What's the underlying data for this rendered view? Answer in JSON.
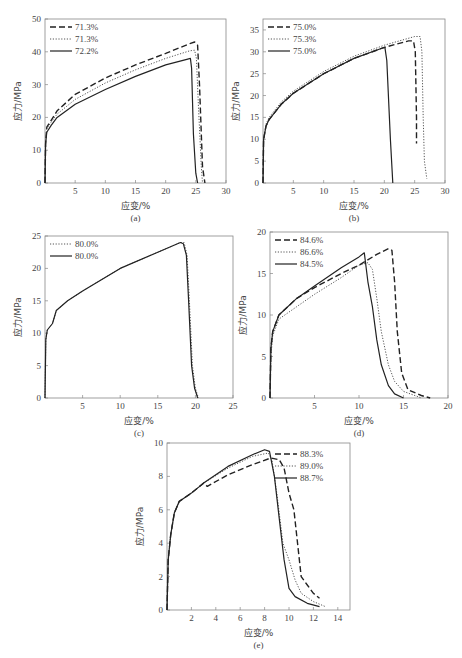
{
  "chart_data": [
    {
      "id": "a",
      "type": "line",
      "caption": "(a)",
      "xlabel": "应变/%",
      "ylabel": "应力/MPa",
      "xlim": [
        0,
        30
      ],
      "ylim": [
        0,
        50
      ],
      "xticks": [
        5,
        10,
        15,
        20,
        25,
        30
      ],
      "yticks": [
        0,
        10,
        20,
        30,
        40,
        50
      ],
      "legend_position": "upper left",
      "frame": {
        "x0": 45,
        "x1": 226,
        "y0": 183,
        "y1": 19
      },
      "series": [
        {
          "name": "71.3%",
          "style": "dashed",
          "x": [
            0,
            0.1,
            0.3,
            1,
            2,
            5,
            10,
            15,
            20,
            24,
            24.8,
            25.3,
            25.6,
            26.1,
            26.5
          ],
          "y": [
            0,
            12,
            17,
            19,
            22,
            27,
            32,
            36,
            39.5,
            42.5,
            43,
            42,
            30,
            5,
            0
          ]
        },
        {
          "name": "71.3%",
          "style": "dotted",
          "x": [
            0,
            0.1,
            0.3,
            1,
            2,
            5,
            10,
            15,
            20,
            24,
            24.8,
            25.1,
            25.4,
            25.9,
            26.1
          ],
          "y": [
            0,
            12,
            16.5,
            18.5,
            21,
            25.5,
            30.5,
            34.5,
            38,
            40.3,
            40.5,
            38,
            25,
            5,
            0
          ]
        },
        {
          "name": "72.2%",
          "style": "solid",
          "x": [
            0,
            0.1,
            0.3,
            1,
            2,
            5,
            10,
            15,
            20,
            23.5,
            24.1,
            24.3,
            24.6,
            25,
            25.3
          ],
          "y": [
            0,
            12,
            15.5,
            17.5,
            20,
            24,
            28.5,
            32.5,
            36,
            37.7,
            38,
            35,
            15,
            3,
            0
          ]
        }
      ]
    },
    {
      "id": "b",
      "type": "line",
      "caption": "(b)",
      "xlabel": "应变/%",
      "ylabel": "应力/MPa",
      "xlim": [
        0,
        30
      ],
      "ylim": [
        0,
        37.5
      ],
      "xticks": [
        5,
        10,
        15,
        20,
        25,
        30
      ],
      "yticks": [
        0,
        5,
        10,
        15,
        20,
        25,
        30,
        35
      ],
      "legend_position": "upper left",
      "frame": {
        "x0": 263,
        "x1": 445,
        "y0": 183,
        "y1": 19
      },
      "series": [
        {
          "name": "75.0%",
          "style": "dashed",
          "x": [
            0,
            0.1,
            0.5,
            1,
            3,
            5,
            10,
            15,
            20,
            24,
            24.8,
            25.1,
            25.3,
            25.3
          ],
          "y": [
            0,
            10,
            13,
            14.5,
            18,
            20.5,
            25,
            28.5,
            31,
            32.5,
            32.5,
            30,
            15,
            9
          ]
        },
        {
          "name": "75.3%",
          "style": "dotted",
          "x": [
            0,
            0.1,
            0.5,
            1,
            3,
            5,
            10,
            15,
            20,
            25,
            25.9,
            26.2,
            26.4,
            26.6,
            27
          ],
          "y": [
            0,
            10,
            13.5,
            15,
            18.5,
            21,
            25.5,
            29,
            31.5,
            33.5,
            33.5,
            30,
            15,
            5,
            1
          ]
        },
        {
          "name": "75.0%",
          "style": "solid",
          "x": [
            0,
            0.1,
            0.5,
            1,
            3,
            5,
            10,
            15,
            19.6,
            20.1,
            20.4,
            21,
            21.4
          ],
          "y": [
            0,
            10,
            13,
            14.5,
            18,
            20.5,
            25,
            28.5,
            30.8,
            31,
            28,
            10,
            0
          ]
        }
      ]
    },
    {
      "id": "c",
      "type": "line",
      "caption": "(c)",
      "xlabel": "应变/%",
      "ylabel": "应力/MPa",
      "xlim": [
        0,
        25
      ],
      "ylim": [
        0,
        25
      ],
      "xticks": [
        5,
        10,
        15,
        20,
        25
      ],
      "yticks": [
        0,
        5,
        10,
        15,
        20,
        25
      ],
      "legend_position": "upper left",
      "frame": {
        "x0": 45,
        "x1": 233,
        "y0": 398,
        "y1": 236
      },
      "series": [
        {
          "name": "80.0%",
          "style": "dotted",
          "x": [
            0,
            0.1,
            0.3,
            1,
            1.5,
            3,
            5,
            10,
            15,
            18,
            18.5,
            18.9,
            19.2,
            19.6,
            20,
            20.4
          ],
          "y": [
            0,
            9,
            10.5,
            11.5,
            13.5,
            15,
            16.5,
            20,
            22.5,
            24,
            24,
            22,
            15,
            5,
            1.5,
            0
          ]
        },
        {
          "name": "80.0%",
          "style": "solid",
          "x": [
            0,
            0.1,
            0.3,
            1,
            1.5,
            3,
            5,
            10,
            15,
            18,
            18.4,
            18.8,
            19.1,
            19.5,
            19.9,
            20.3
          ],
          "y": [
            0,
            9,
            10.5,
            11.5,
            13.5,
            15,
            16.5,
            20,
            22.5,
            24,
            23.8,
            22,
            15,
            5,
            1.5,
            0
          ]
        }
      ]
    },
    {
      "id": "d",
      "type": "line",
      "caption": "(d)",
      "xlabel": "应变/%",
      "ylabel": "应力/MPa",
      "xlim": [
        0,
        20
      ],
      "ylim": [
        0,
        20
      ],
      "xticks": [
        5,
        10,
        15,
        20
      ],
      "yticks": [
        0,
        5,
        10,
        15,
        20
      ],
      "legend_position": "upper left",
      "frame": {
        "x0": 270,
        "x1": 448,
        "y0": 398,
        "y1": 232
      },
      "series": [
        {
          "name": "84.6%",
          "style": "dashed",
          "x": [
            0,
            0.1,
            0.3,
            1,
            3,
            5,
            8,
            10,
            12,
            13.3,
            13.7,
            14,
            14.3,
            14.8,
            15.5,
            17,
            18
          ],
          "y": [
            0,
            6,
            8,
            10,
            12,
            13.3,
            15,
            16,
            17.3,
            18,
            17.8,
            14,
            8,
            3,
            1,
            0.3,
            0
          ]
        },
        {
          "name": "86.6%",
          "style": "dotted",
          "x": [
            0,
            0.1,
            0.3,
            1,
            3,
            5,
            8,
            10,
            11,
            11.5,
            12,
            12.5,
            13.3,
            14,
            15,
            16.5,
            17
          ],
          "y": [
            0,
            5,
            7.5,
            9.5,
            11,
            12.5,
            14.5,
            16,
            16.3,
            15.5,
            12,
            8,
            4,
            2,
            0.8,
            0.2,
            0
          ]
        },
        {
          "name": "84.5%",
          "style": "solid",
          "x": [
            0,
            0.1,
            0.3,
            1,
            3,
            5,
            8,
            10,
            10.6,
            11,
            11.5,
            12,
            12.5,
            13.3,
            14,
            15
          ],
          "y": [
            0,
            6,
            8,
            10,
            12,
            13.5,
            15.7,
            17,
            17.5,
            14,
            11,
            7,
            4,
            1.5,
            0.5,
            0
          ]
        }
      ]
    },
    {
      "id": "e",
      "type": "line",
      "caption": "(e)",
      "xlabel": "应变/%",
      "ylabel": "应力/MPa",
      "xlim": [
        0,
        15
      ],
      "ylim": [
        0,
        10
      ],
      "xticks": [
        2,
        4,
        6,
        8,
        10,
        12,
        14
      ],
      "yticks": [
        0,
        2,
        4,
        6,
        8,
        10
      ],
      "legend_position": "upper right",
      "frame": {
        "x0": 167,
        "x1": 350,
        "y0": 610,
        "y1": 443
      },
      "series": [
        {
          "name": "88.3%",
          "style": "dashed",
          "x": [
            0,
            0.1,
            0.3,
            0.6,
            1,
            2,
            3,
            3.3,
            5,
            7,
            8.5,
            9.2,
            9.6,
            10,
            10.4,
            11,
            11.5,
            12,
            12.5
          ],
          "y": [
            0,
            3,
            4.5,
            5.8,
            6.5,
            7,
            7.6,
            7.4,
            8.1,
            8.7,
            9.1,
            9.0,
            8.5,
            7,
            6,
            2,
            1.5,
            1,
            0.7
          ]
        },
        {
          "name": "89.0%",
          "style": "dotted",
          "x": [
            0,
            0.1,
            0.3,
            0.6,
            1,
            2,
            3,
            5,
            7,
            8.3,
            8.6,
            9,
            9.5,
            10,
            10.5,
            11,
            12,
            13
          ],
          "y": [
            0,
            3,
            4.5,
            5.8,
            6.5,
            7,
            7.6,
            8.5,
            9.2,
            9.4,
            9,
            7,
            4,
            3,
            1.8,
            1,
            0.5,
            0.2
          ]
        },
        {
          "name": "88.7%",
          "style": "solid",
          "x": [
            0,
            0.1,
            0.3,
            0.6,
            1,
            2,
            3,
            5,
            7,
            8,
            8.4,
            8.8,
            9.2,
            9.6,
            10,
            10.5,
            11.5,
            12.5
          ],
          "y": [
            0,
            3,
            4.5,
            5.8,
            6.5,
            7,
            7.6,
            8.6,
            9.3,
            9.6,
            9.5,
            8,
            5.5,
            3,
            1.3,
            0.8,
            0.4,
            0.2
          ]
        }
      ]
    }
  ]
}
